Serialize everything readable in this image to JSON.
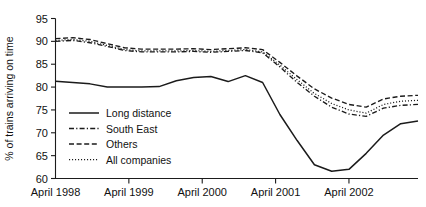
{
  "chart_data": {
    "type": "line",
    "title": "",
    "xlabel": "",
    "ylabel": "% of trains arriving on time",
    "ylim": [
      60,
      95
    ],
    "yticks": [
      60,
      65,
      70,
      75,
      80,
      85,
      90,
      95
    ],
    "xticks": [
      "April 1998",
      "April 1999",
      "April 2000",
      "April 2001",
      "April 2002"
    ],
    "xlim": [
      0,
      17
    ],
    "grid": false,
    "legend_position": "inside-left-lower",
    "x": [
      0,
      1,
      2,
      3,
      4,
      5,
      6,
      7,
      8,
      9,
      10,
      11,
      12,
      13,
      14,
      15,
      16,
      17
    ],
    "series": [
      {
        "name": "Long distance",
        "style": "solid",
        "values": [
          81.3,
          81.0,
          80.7,
          80.0,
          80.0,
          80.0,
          80.1,
          81.4,
          82.1,
          82.3,
          81.2,
          82.5,
          81.0,
          74.0,
          68.3,
          63.0,
          61.6,
          62.0
        ]
      },
      {
        "name": "South East",
        "style": "dashdot",
        "values": [
          90.0,
          90.2,
          89.7,
          88.9,
          88.0,
          87.7,
          87.7,
          87.7,
          87.8,
          87.6,
          87.8,
          88.0,
          87.5,
          84.4,
          81.0,
          78.0,
          75.6,
          74.1
        ]
      },
      {
        "name": "Others",
        "style": "dashed",
        "values": [
          90.6,
          90.8,
          90.4,
          89.5,
          88.6,
          88.3,
          88.3,
          88.3,
          88.4,
          88.2,
          88.4,
          88.6,
          88.2,
          85.4,
          82.4,
          79.6,
          77.6,
          76.2
        ]
      },
      {
        "name": "All companies",
        "style": "dotted",
        "values": [
          90.2,
          90.4,
          90.0,
          89.1,
          88.2,
          87.9,
          87.9,
          87.9,
          88.0,
          87.8,
          88.0,
          88.2,
          87.7,
          84.8,
          81.6,
          78.6,
          76.4,
          75.0
        ]
      }
    ],
    "series_tail": {
      "x": [
        17,
        18,
        19,
        20,
        21
      ],
      "Long distance": [
        62.0,
        65.5,
        69.5,
        72.0,
        72.6
      ],
      "South East": [
        74.1,
        73.6,
        75.4,
        76.0,
        76.2
      ],
      "Others": [
        76.2,
        75.6,
        77.4,
        78.0,
        78.2
      ],
      "All companies": [
        75.0,
        74.3,
        76.2,
        76.9,
        77.1
      ]
    }
  },
  "legend": {
    "items": [
      {
        "label": "Long distance",
        "style": "solid"
      },
      {
        "label": "South East",
        "style": "dashdot"
      },
      {
        "label": "Others",
        "style": "dashed"
      },
      {
        "label": "All companies",
        "style": "dotted"
      }
    ]
  }
}
